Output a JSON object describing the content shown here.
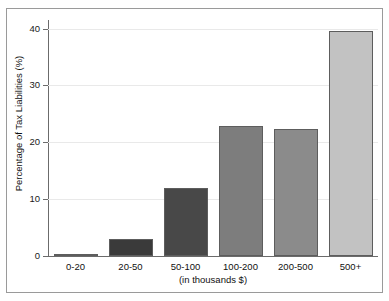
{
  "chart_data": {
    "type": "bar",
    "title": "",
    "subtitle": "",
    "xlabel": "(in thousands $)",
    "ylabel": "Percentage of Tax Liabilities (%)",
    "categories": [
      "0-20",
      "20-50",
      "50-100",
      "100-200",
      "200-500",
      "500+"
    ],
    "values": [
      0.2,
      3.0,
      12.0,
      22.8,
      22.3,
      39.6
    ],
    "series": [
      {
        "name": "Percentage of Tax Liabilities",
        "values": [
          0.2,
          3.0,
          12.0,
          22.8,
          22.3,
          39.6
        ]
      }
    ],
    "bar_colors": [
      "#585858",
      "#3a3a3a",
      "#484848",
      "#7d7d7d",
      "#8b8b8b",
      "#c2c2c2"
    ],
    "bar_edge_color": "#5d5d5d",
    "ylim": [
      0,
      41.5
    ],
    "yticks": [
      0,
      10,
      20,
      30,
      40
    ],
    "ytick_labels": [
      "0",
      "10",
      "20",
      "30",
      "40"
    ],
    "grid": true,
    "grid_color": "#e9e9e9",
    "legend": "none",
    "legend_position": "none",
    "axis_color": "#6b6b6b",
    "frame_color": "#9a9a9a",
    "background": "#ffffff"
  },
  "figure": {
    "width": 389,
    "height": 301
  }
}
